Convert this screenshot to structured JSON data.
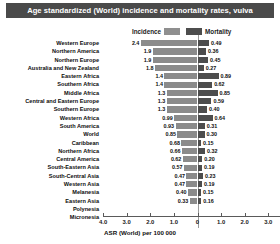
{
  "title": "Age standardized (World) incidence and mortality rates, vulva",
  "legend": {
    "incidence_label": "Incidence",
    "mortality_label": "Mortality",
    "incidence_color": "#8b8b8b",
    "mortality_color": "#4d4d4d"
  },
  "axis": {
    "title": "ASR (World) per 100 000",
    "tick_labels": [
      "4.0",
      "3.0",
      "2.0",
      "1.0",
      "0",
      "1.0",
      "2.0",
      "3.0",
      "4.0"
    ]
  },
  "chart_data": {
    "type": "bar",
    "title": "Age standardized (World) incidence and mortality rates, vulva",
    "subtype": "diverging-horizontal-bar",
    "xlabel": "ASR (World) per 100 000",
    "ylabel": "",
    "xlim": [
      -4.0,
      4.0
    ],
    "xticks": [
      -4.0,
      -3.0,
      -2.0,
      -1.0,
      0,
      1.0,
      2.0,
      3.0,
      4.0
    ],
    "xtick_labels": [
      "4.0",
      "3.0",
      "2.0",
      "1.0",
      "0",
      "1.0",
      "2.0",
      "3.0",
      "4.0"
    ],
    "grid": false,
    "legend_position": "top-center",
    "categories": [
      "Western Europe",
      "Northern America",
      "Northern Europe",
      "Australia and New Zealand",
      "Eastern Africa",
      "Southern Africa",
      "Middle Africa",
      "Central and Eastern Europe",
      "Southern Europe",
      "Western Africa",
      "South America",
      "World",
      "Caribbean",
      "Northern Africa",
      "Central America",
      "South-Eastern Asia",
      "South-Central Asia",
      "Western Asia",
      "Melanesia",
      "Eastern Asia",
      "Polynesia",
      "Micronesia"
    ],
    "series": [
      {
        "name": "Incidence",
        "direction": "left",
        "color": "#8b8b8b",
        "values": [
          2.4,
          1.9,
          1.9,
          1.8,
          1.4,
          1.4,
          1.3,
          1.3,
          1.3,
          0.99,
          0.93,
          0.85,
          0.68,
          0.66,
          0.62,
          0.57,
          0.47,
          0.47,
          0.4,
          0.33,
          null,
          null
        ],
        "labels": [
          "2.4",
          "1.9",
          "1.9",
          "1.8",
          "1.4",
          "1.4",
          "1.3",
          "1.3",
          "1.3",
          "0.99",
          "0.93",
          "0.85",
          "0.68",
          "0.66",
          "0.62",
          "0.57",
          "0.47",
          "0.47",
          "0.40",
          "0.33",
          "",
          ""
        ]
      },
      {
        "name": "Mortality",
        "direction": "right",
        "color": "#4d4d4d",
        "values": [
          0.49,
          0.36,
          0.45,
          0.27,
          0.89,
          0.62,
          0.85,
          0.59,
          0.4,
          0.64,
          0.31,
          0.3,
          0.15,
          0.32,
          0.2,
          0.19,
          0.23,
          0.19,
          0.15,
          0.16,
          null,
          null
        ],
        "labels": [
          "0.49",
          "0.36",
          "0.45",
          "0.27",
          "0.89",
          "0.62",
          "0.85",
          "0.59",
          "0.40",
          "0.64",
          "0.31",
          "0.30",
          "0.15",
          "0.32",
          "0.20",
          "0.19",
          "0.23",
          "0.19",
          "0.15",
          "0.16",
          "",
          ""
        ]
      }
    ]
  }
}
